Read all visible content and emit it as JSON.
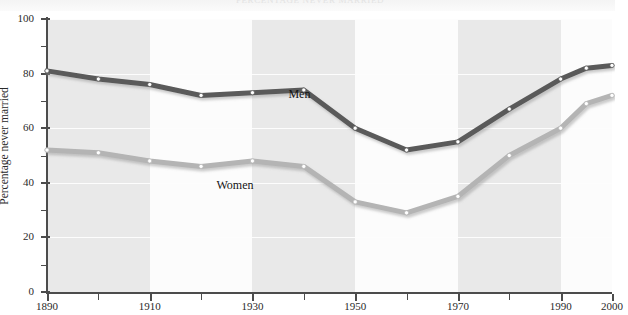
{
  "page": {
    "running_head": "PERCENTAGE NEVER MARRIED"
  },
  "chart_data": {
    "type": "line",
    "title": "",
    "xlabel": "",
    "ylabel": "Percentage never married",
    "xlim": [
      1890,
      2000
    ],
    "ylim": [
      0,
      100
    ],
    "grid": true,
    "legend_position": "inline-annotation",
    "x_ticks_major": [
      1890,
      1910,
      1930,
      1950,
      1970,
      1990,
      2000
    ],
    "x_ticks_minor": [
      1900,
      1920,
      1940,
      1960,
      1980
    ],
    "y_ticks_major": [
      0,
      20,
      40,
      60,
      80,
      100
    ],
    "y_ticks_minor": [
      10,
      30,
      50,
      70,
      90
    ],
    "x": [
      1890,
      1900,
      1910,
      1920,
      1930,
      1940,
      1950,
      1960,
      1970,
      1980,
      1990,
      1995,
      2000
    ],
    "series": [
      {
        "name": "Men",
        "color": "#5a5a5a",
        "values": [
          81,
          78,
          76,
          72,
          73,
          74,
          60,
          52,
          55,
          67,
          78,
          82,
          83
        ]
      },
      {
        "name": "Women",
        "color": "#b4b4b4",
        "values": [
          52,
          51,
          48,
          46,
          48,
          46,
          33,
          29,
          35,
          50,
          60,
          69,
          72
        ]
      }
    ],
    "annotations": [
      {
        "text": "Men",
        "x": 1937,
        "y": 72
      },
      {
        "text": "Women",
        "x": 1923,
        "y": 39
      }
    ],
    "colors": {
      "men_line": "#5a5a5a",
      "women_line": "#b4b4b4",
      "marker_fill": "#ffffff",
      "axis": "#4c4c4c",
      "band_shaded": "#e9e9e9",
      "band_plain": "#fcfcfc",
      "gridline": "#fdfdfd"
    }
  }
}
